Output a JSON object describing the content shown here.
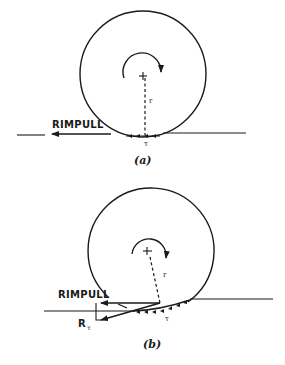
{
  "figure": {
    "panel_a": {
      "caption": "(a)",
      "rimpull_label": "RIMPULL",
      "radius_label": "r",
      "shear_label": "τ"
    },
    "panel_b": {
      "caption": "(b)",
      "rimpull_label": "RIMPULL",
      "radius_label": "r",
      "shear_label": "τ",
      "resultant_label": "R",
      "resultant_subscript": "τ"
    }
  },
  "colors": {
    "ink": "#1a1a1a",
    "background": "#ffffff"
  }
}
